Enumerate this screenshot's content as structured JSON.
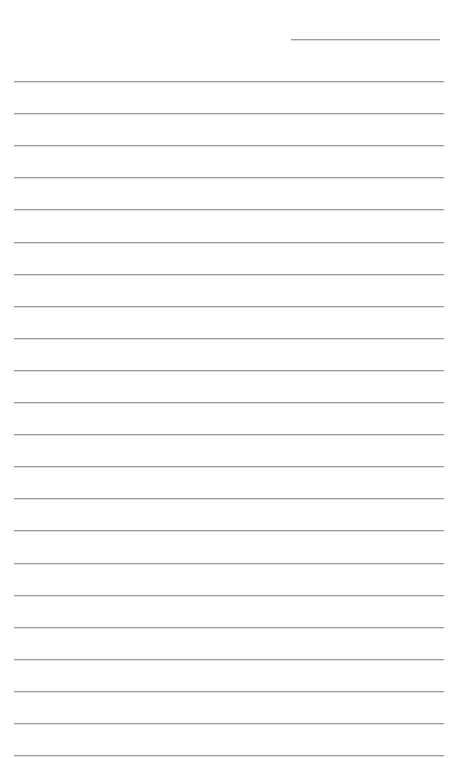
{
  "page": {
    "width": 460,
    "height": 758,
    "background_color": "#ffffff"
  },
  "styles": {
    "rule_color": "#9c9c9c",
    "rule_thickness_px": 1
  },
  "date_rule": {
    "name": "date-rule",
    "x": 291,
    "y": 39,
    "width": 149,
    "value": "",
    "placeholder": ""
  },
  "ruled_lines": {
    "count": 22,
    "x": 14,
    "width": 430,
    "first_y": 81,
    "spacing": 32.1,
    "entries": [
      {
        "index": 1,
        "y": 81.0,
        "value": ""
      },
      {
        "index": 2,
        "y": 113.1,
        "value": ""
      },
      {
        "index": 3,
        "y": 145.2,
        "value": ""
      },
      {
        "index": 4,
        "y": 177.3,
        "value": ""
      },
      {
        "index": 5,
        "y": 209.4,
        "value": ""
      },
      {
        "index": 6,
        "y": 241.5,
        "value": ""
      },
      {
        "index": 7,
        "y": 273.6,
        "value": ""
      },
      {
        "index": 8,
        "y": 305.7,
        "value": ""
      },
      {
        "index": 9,
        "y": 337.8,
        "value": ""
      },
      {
        "index": 10,
        "y": 369.9,
        "value": ""
      },
      {
        "index": 11,
        "y": 402.0,
        "value": ""
      },
      {
        "index": 12,
        "y": 434.1,
        "value": ""
      },
      {
        "index": 13,
        "y": 466.2,
        "value": ""
      },
      {
        "index": 14,
        "y": 498.3,
        "value": ""
      },
      {
        "index": 15,
        "y": 530.4,
        "value": ""
      },
      {
        "index": 16,
        "y": 562.5,
        "value": ""
      },
      {
        "index": 17,
        "y": 594.6,
        "value": ""
      },
      {
        "index": 18,
        "y": 626.7,
        "value": ""
      },
      {
        "index": 19,
        "y": 658.8,
        "value": ""
      },
      {
        "index": 20,
        "y": 690.9,
        "value": ""
      },
      {
        "index": 21,
        "y": 723.0,
        "value": ""
      },
      {
        "index": 22,
        "y": 755.1,
        "value": ""
      }
    ]
  }
}
